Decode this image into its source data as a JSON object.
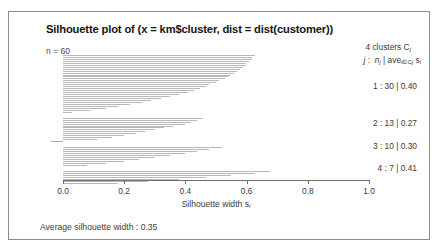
{
  "figure": {
    "title": "Silhouette plot of (x = km$cluster, dist = dist(customer))",
    "n_label": "n = 60",
    "average_width_label": "Average silhouette width : 0.35"
  },
  "legend": {
    "header_line1_prefix": "4  clusters  C",
    "header_line1_sub": "j",
    "header_line2": "j :  n  | ave       s",
    "rows": [
      {
        "label": "1 :   30  |  0.40"
      },
      {
        "label": "2 :   13  |  0.27"
      },
      {
        "label": "3 :   10  |  0.30"
      },
      {
        "label": "4 :    7  |  0.41"
      }
    ]
  },
  "axis": {
    "title_main": "Silhouette width s",
    "title_sub": "i",
    "ticks": [
      "0.0",
      "0.2",
      "0.4",
      "0.6",
      "0.8",
      "1.0"
    ],
    "tick_values": [
      0.0,
      0.2,
      0.4,
      0.6,
      0.8,
      1.0
    ],
    "xlim": [
      0.0,
      1.0
    ]
  },
  "chart_data": {
    "type": "bar",
    "orientation": "horizontal",
    "title": "Silhouette plot of (x = km$cluster, dist = dist(customer))",
    "xlabel": "Silhouette width s_i",
    "ylabel": "",
    "xlim": [
      0.0,
      1.0
    ],
    "grid": false,
    "n": 60,
    "average_silhouette_width": 0.35,
    "annotations": [
      "n = 60",
      "4 clusters C_j",
      "j : n_j | ave_{i in Cj} s_i",
      "Average silhouette width : 0.35"
    ],
    "clusters": [
      {
        "cluster": 1,
        "size": 30,
        "average_width": 0.4,
        "values": [
          0.63,
          0.62,
          0.62,
          0.61,
          0.6,
          0.6,
          0.59,
          0.58,
          0.57,
          0.56,
          0.55,
          0.54,
          0.53,
          0.51,
          0.5,
          0.48,
          0.47,
          0.45,
          0.43,
          0.41,
          0.38,
          0.35,
          0.32,
          0.29,
          0.26,
          0.22,
          0.18,
          0.14,
          0.09,
          0.03
        ]
      },
      {
        "cluster": 2,
        "size": 13,
        "average_width": 0.27,
        "values": [
          0.46,
          0.44,
          0.42,
          0.4,
          0.36,
          0.33,
          0.3,
          0.27,
          0.24,
          0.2,
          0.16,
          0.11,
          -0.04
        ]
      },
      {
        "cluster": 3,
        "size": 10,
        "average_width": 0.3,
        "values": [
          0.52,
          0.48,
          0.44,
          0.4,
          0.35,
          0.3,
          0.25,
          0.2,
          0.14,
          0.08
        ]
      },
      {
        "cluster": 4,
        "size": 7,
        "average_width": 0.41,
        "values": [
          0.68,
          0.63,
          0.55,
          0.47,
          0.38,
          0.28,
          0.18
        ]
      }
    ]
  }
}
